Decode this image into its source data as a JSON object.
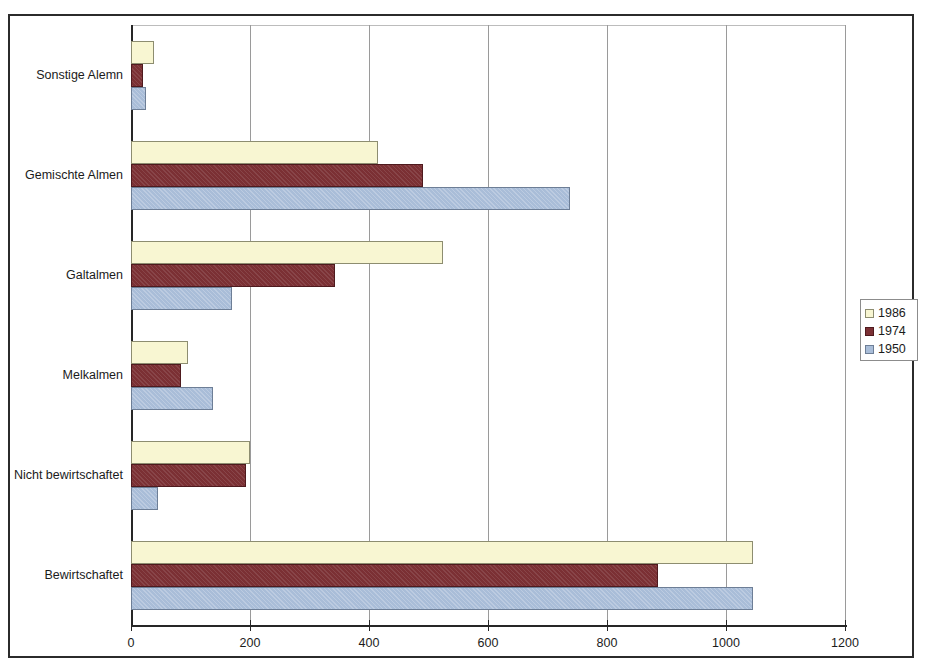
{
  "chart_data": {
    "type": "bar",
    "orientation": "horizontal",
    "title": "",
    "xlabel": "",
    "ylabel": "",
    "categories": [
      "Sonstige Alemn",
      "Gemischte Almen",
      "Galtalmen",
      "Melkalmen",
      "Nicht bewirtschaftet",
      "Bewirtschaftet"
    ],
    "series": [
      {
        "name": "1986",
        "color": "#f8f6d2",
        "values": [
          39,
          415,
          525,
          96,
          200,
          1045
        ]
      },
      {
        "name": "1974",
        "color": "#7b3034",
        "values": [
          21,
          490,
          343,
          84,
          193,
          885
        ]
      },
      {
        "name": "1950",
        "color": "#a9bdd8",
        "values": [
          25,
          738,
          170,
          138,
          46,
          1045
        ]
      }
    ],
    "xlim": [
      0,
      1200
    ],
    "xticks": [
      0,
      200,
      400,
      600,
      800,
      1000,
      1200
    ],
    "xtick_labels": [
      "0",
      "200",
      "400",
      "600",
      "800",
      "1000",
      "1200"
    ],
    "grid": true,
    "grid_axis": "x",
    "legend": {
      "position": "right",
      "entries": [
        "1986",
        "1974",
        "1950"
      ]
    }
  },
  "legend": {
    "entries": [
      {
        "label": "1986",
        "swatch": "legend-swatch-1986"
      },
      {
        "label": "1974",
        "swatch": "legend-swatch-1974"
      },
      {
        "label": "1950",
        "swatch": "legend-swatch-1950"
      }
    ]
  }
}
